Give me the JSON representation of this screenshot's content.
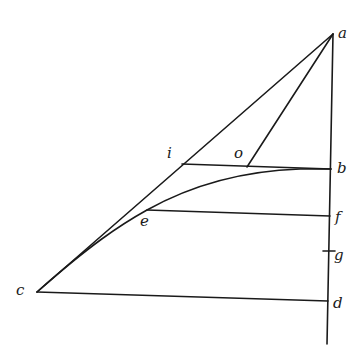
{
  "figure": {
    "type": "geometric-construction",
    "stroke_color": "#1a1a1a",
    "background": "#ffffff",
    "points": {
      "a": {
        "label": "a",
        "x": 333,
        "y": 34
      },
      "b": {
        "label": "b",
        "x": 331,
        "y": 169
      },
      "c": {
        "label": "c",
        "x": 37,
        "y": 292
      },
      "d": {
        "label": "d",
        "x": 328,
        "y": 301
      },
      "e": {
        "label": "e",
        "x": 147,
        "y": 210
      },
      "f": {
        "label": "f",
        "x": 330,
        "y": 216
      },
      "g": {
        "label": "g",
        "x": 329,
        "y": 251
      },
      "i": {
        "label": "i",
        "x": 182,
        "y": 164
      },
      "o": {
        "label": "o",
        "x": 247,
        "y": 167
      }
    },
    "segments": [
      "a-c (hypotenuse through i)",
      "a-o",
      "a-d (vertical, extended below d)",
      "i-b",
      "e-f",
      "c-d"
    ],
    "curves": [
      "c-e-b (tangent to ac near c, meeting ib horizontally near b)"
    ],
    "ticks": [
      "g"
    ]
  },
  "labels": {
    "a": "a",
    "b": "b",
    "c": "c",
    "d": "d",
    "e": "e",
    "f": "f",
    "g": "g",
    "i": "i",
    "o": "o"
  }
}
